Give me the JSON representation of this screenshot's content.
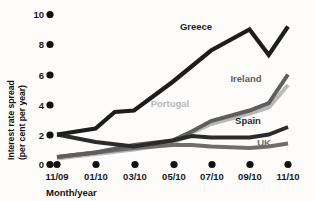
{
  "chart_data": {
    "type": "line",
    "title": "",
    "xlabel": "Month/year",
    "ylabel": "Interest rate spread (per cent per year)",
    "ylabel_line1": "Interest rate spread",
    "ylabel_line2": "(per cent per year)",
    "categories": [
      "11/09",
      "01/10",
      "03/10",
      "05/10",
      "07/10",
      "09/10",
      "11/10"
    ],
    "x_tick_labels": [
      "11/09",
      "01/10",
      "03/10",
      "05/10",
      "07/10",
      "09/10",
      "11/10"
    ],
    "y_tick_labels": [
      "0",
      "2",
      "4",
      "6",
      "8",
      "10"
    ],
    "y_ticks": [
      0,
      2,
      4,
      6,
      8,
      10
    ],
    "ylim": [
      0,
      10.4
    ],
    "grid": false,
    "legend_position": "inline-labels",
    "series": [
      {
        "name": "Greece",
        "color": "#1d1d1d",
        "label_x": 196,
        "label_y": 30,
        "values": [
          2.0,
          2.4,
          3.5,
          3.6,
          5.5,
          7.6,
          9.0,
          7.3,
          9.2
        ],
        "x_values": [
          "11/09",
          "01/10",
          "02/10",
          "03/10",
          "05/10",
          "07/10",
          "09/10",
          "10/10",
          "11/10"
        ]
      },
      {
        "name": "Ireland",
        "color": "#5e5e5e",
        "label_x": 246,
        "label_y": 82,
        "values": [
          0.5,
          0.8,
          1.3,
          1.6,
          2.2,
          2.9,
          3.6,
          4.1,
          6.0
        ],
        "x_values": [
          "11/09",
          "01/10",
          "03/10",
          "05/10",
          "06/10",
          "07/10",
          "09/10",
          "10/10",
          "11/10"
        ]
      },
      {
        "name": "Portugal",
        "color": "#b8b8b8",
        "label_x": 170,
        "label_y": 107,
        "values": [
          0.4,
          0.7,
          1.0,
          1.4,
          2.1,
          2.7,
          3.4,
          3.8,
          5.3
        ],
        "x_values": [
          "11/09",
          "01/10",
          "03/10",
          "05/10",
          "06/10",
          "07/10",
          "09/10",
          "10/10",
          "11/10"
        ]
      },
      {
        "name": "Spain",
        "color": "#2b2b2b",
        "label_x": 248,
        "label_y": 124,
        "values": [
          2.0,
          1.5,
          1.2,
          1.6,
          1.9,
          1.8,
          1.8,
          2.0,
          2.5
        ],
        "x_values": [
          "11/09",
          "01/10",
          "03/10",
          "05/10",
          "06/10",
          "07/10",
          "09/10",
          "10/10",
          "11/10"
        ]
      },
      {
        "name": "UK",
        "color": "#6e6e6e",
        "label_x": 264,
        "label_y": 146,
        "values": [
          0.5,
          0.8,
          1.1,
          1.3,
          1.3,
          1.2,
          1.1,
          1.2,
          1.4
        ],
        "x_values": [
          "11/09",
          "01/10",
          "03/10",
          "05/10",
          "06/10",
          "07/10",
          "09/10",
          "10/10",
          "11/10"
        ]
      }
    ]
  },
  "axis": {
    "x_title": "Month/year",
    "y_title_line1": "Interest rate spread",
    "y_title_line2": "(per cent per year)"
  },
  "colors": {
    "background": "#fdfcfa",
    "text": "#111111",
    "greece": "#1d1d1d",
    "ireland": "#5e5e5e",
    "portugal": "#b8b8b8",
    "spain": "#2b2b2b",
    "uk": "#6e6e6e"
  }
}
